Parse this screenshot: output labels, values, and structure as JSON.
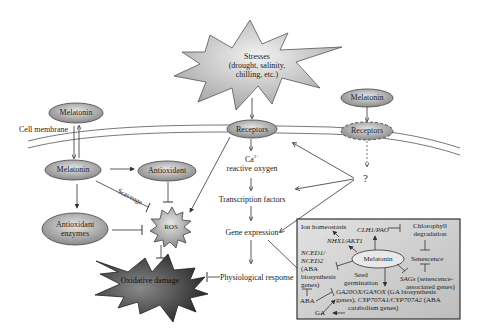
{
  "diagram": {
    "stresses": {
      "line1": "Stresses",
      "line2": "(drought, salinity,",
      "line3": "chilling, etc.)"
    },
    "left": {
      "melatonin_outside": "Melatonin",
      "cell_membrane": "Cell membrane",
      "melatonin_inside": "Melatonin",
      "antioxidant": "Antioxidant",
      "antioxidant_enzymes_1": "Antioxidant",
      "antioxidant_enzymes_2": "enzymes",
      "scavenge": "Scavenge",
      "ros": "ROS",
      "oxidative_damage": "Oxidative damage"
    },
    "center": {
      "receptors": "Receptors",
      "ca": "Ca",
      "ca_sup": "2+",
      "reactive_oxygen": "reactive oxygen",
      "transcription_factors": "Transcription factors",
      "gene_expression": "Gene expression",
      "physiological_response": "Physiological response"
    },
    "right": {
      "melatonin": "Melatonin",
      "receptors_dashed": "Receptors",
      "question": "?"
    },
    "box": {
      "ion_homeostasis": "Ion homeostasis",
      "nhx1_akt1": "NHX1/AKT1",
      "clh1_pao": "CLH1/PAO",
      "chlorophyll_1": "Chlorophyll",
      "chlorophyll_2": "degradation",
      "nced_1": "NCED1/",
      "nced_2": "NCED2",
      "nced_3": "(ABA",
      "nced_4": "biosynthesis",
      "nced_5": "genes)",
      "melatonin": "Melatonin",
      "senescence": "Senescence",
      "seed_1": "Seed",
      "seed_2": "germination",
      "sags_italic": "SAGs",
      "sags_1": " (senescence-",
      "sags_2": "associated genes)",
      "aba": "ABA",
      "ga": "GA",
      "ga_genes_italic": "GA20OX/GA3OX",
      "ga_genes_1": " (GA biosynthesis",
      "ga_genes_2a": "genes), ",
      "ga_genes_2b": "CYP707A1/CYP707A2",
      "ga_genes_2c": " (ABA",
      "ga_genes_3": "catabolism genes)"
    }
  }
}
